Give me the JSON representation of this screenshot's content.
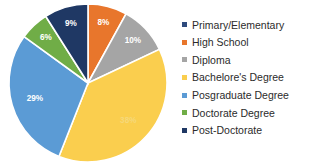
{
  "chart_data": {
    "type": "pie",
    "title": "",
    "subtitle": "",
    "xlabel": "",
    "ylabel": "",
    "legend_position": "right",
    "grid": false,
    "start_angle_deg": 0,
    "direction": "clockwise",
    "categories": [
      "Primary/Elementary",
      "High School",
      "Diploma",
      "Bachelore's Degree",
      "Posgraduate Degree",
      "Doctorate Degree",
      "Post-Doctorate"
    ],
    "values": [
      0,
      8,
      10,
      38,
      29,
      6,
      9
    ],
    "data_labels": [
      "",
      "8%",
      "10%",
      "38%",
      "29%",
      "6%",
      "9%"
    ],
    "colors": [
      "#2E4A7D",
      "#E8762C",
      "#A5A5A5",
      "#FACE4E",
      "#5B9BD5",
      "#70AD47",
      "#1F3864"
    ],
    "slices": [
      {
        "label": "High School",
        "value": 8,
        "data_label": "8%",
        "color": "#E8762C"
      },
      {
        "label": "Diploma",
        "value": 10,
        "data_label": "10%",
        "color": "#A5A5A5"
      },
      {
        "label": "Bachelore's Degree",
        "value": 38,
        "data_label": "38%",
        "color": "#FACE4E"
      },
      {
        "label": "Posgraduate Degree",
        "value": 29,
        "data_label": "29%",
        "color": "#5B9BD5"
      },
      {
        "label": "Doctorate Degree",
        "value": 6,
        "data_label": "6%",
        "color": "#70AD47"
      },
      {
        "label": "Post-Doctorate",
        "value": 9,
        "data_label": "9%",
        "color": "#1F3864"
      }
    ]
  },
  "legend": {
    "items": [
      {
        "label": "Primary/Elementary",
        "color": "#2E4A7D"
      },
      {
        "label": "High School",
        "color": "#E8762C"
      },
      {
        "label": "Diploma",
        "color": "#A5A5A5"
      },
      {
        "label": "Bachelore's Degree",
        "color": "#FACE4E"
      },
      {
        "label": "Posgraduate Degree",
        "color": "#5B9BD5"
      },
      {
        "label": "Doctorate Degree",
        "color": "#70AD47"
      },
      {
        "label": "Post-Doctorate",
        "color": "#1F3864"
      }
    ]
  }
}
